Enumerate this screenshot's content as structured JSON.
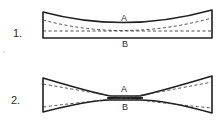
{
  "figures": [
    {
      "number_label": "1.",
      "top_label": "A",
      "bottom_label": "B",
      "description": "Slightly concave shape with dashed lines"
    },
    {
      "number_label": "2.",
      "top_label": "A",
      "bottom_label": "B",
      "description": "Hourglass (bowtie) shape pinched at the center with dashed diagonals"
    }
  ],
  "colors": {
    "ink": "#1f1f1f",
    "background": "#ffffff"
  }
}
